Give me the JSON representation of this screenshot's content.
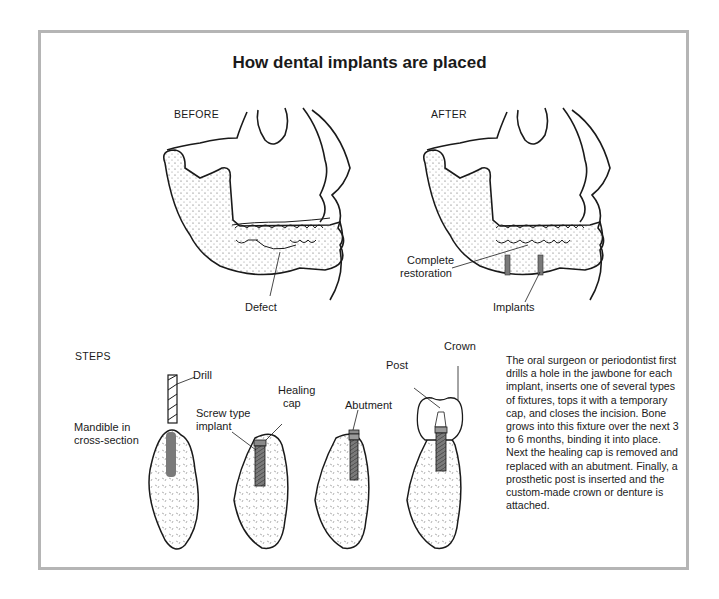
{
  "figure": {
    "title": "How dental implants are placed",
    "panels": {
      "before": {
        "label": "BEFORE",
        "callouts": [
          "Defect"
        ]
      },
      "after": {
        "label": "AFTER",
        "callouts": [
          "Complete restoration",
          "Implants"
        ]
      }
    },
    "steps": {
      "heading": "STEPS",
      "labels": {
        "drill": "Drill",
        "mandible_line1": "Mandible in",
        "mandible_line2": "cross-section",
        "screw_line1": "Screw type",
        "screw_line2": "implant",
        "healing_line1": "Healing",
        "healing_line2": "cap",
        "abutment": "Abutment",
        "post": "Post",
        "crown": "Crown"
      }
    },
    "complete_line1": "Complete",
    "complete_line2": "restoration",
    "description": "The oral surgeon or periodontist first drills a hole in the jawbone for each implant, inserts one of several types of fixtures, tops it with a temporary cap, and closes the incision. Bone grows into this fixture over the next 3 to 6 months, binding it into place. Next the healing cap is removed and replaced with an abutment. Finally, a prosthetic post is inserted and the custom-made crown or denture is attached.",
    "colors": {
      "frame": "#b5b5b5",
      "implant": "#7a7a7a",
      "ink": "#1a1a1a"
    }
  }
}
